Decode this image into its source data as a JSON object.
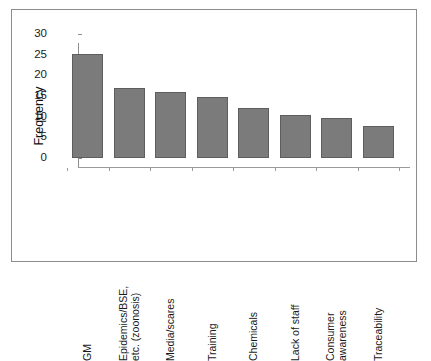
{
  "chart_data": {
    "type": "bar",
    "title": "",
    "subtitle": "",
    "xlabel": "",
    "ylabel": "Frequency",
    "ylim": [
      0,
      30
    ],
    "yticks": [
      0,
      5,
      10,
      15,
      20,
      25,
      30
    ],
    "ytick_labels": [
      "0",
      "5",
      "10",
      "15",
      "20",
      "25",
      "30"
    ],
    "grid": false,
    "legend": null,
    "orientation": "vertical",
    "bar_color": "#7b7b7b",
    "bar_edge_color": "#5e5e5e",
    "categories": [
      "GM",
      "Epidemics/BSE, etc. (zoonosis)",
      "Media/scares",
      "Training",
      "Chemicals",
      "Lack of staff",
      "Consumer awareness",
      "Traceability"
    ],
    "category_lines": [
      [
        "GM"
      ],
      [
        "Epidemics/BSE,",
        "etc. (zoonosis)"
      ],
      [
        "Media/scares"
      ],
      [
        "Training"
      ],
      [
        "Chemicals"
      ],
      [
        "Lack of staff"
      ],
      [
        "Consumer",
        "awareness"
      ],
      [
        "Traceability"
      ]
    ],
    "values": [
      25.2,
      17.0,
      16.0,
      14.7,
      12.0,
      10.4,
      9.6,
      7.8
    ],
    "series": [
      {
        "name": "Frequency",
        "values": [
          25.2,
          17.0,
          16.0,
          14.7,
          12.0,
          10.4,
          9.6,
          7.8
        ]
      }
    ]
  },
  "figure": {
    "frame_color": "#8d8d8d",
    "background": "#ffffff"
  }
}
